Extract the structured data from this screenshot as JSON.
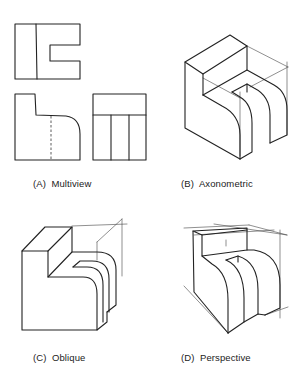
{
  "figure": {
    "panels": [
      {
        "id": "A",
        "label": "(A)",
        "name": "Multiview"
      },
      {
        "id": "B",
        "label": "(B)",
        "name": "Axonometric"
      },
      {
        "id": "C",
        "label": "(C)",
        "name": "Oblique"
      },
      {
        "id": "D",
        "label": "(D)",
        "name": "Perspective"
      }
    ],
    "colors": {
      "line": "#222222",
      "construction": "#444444",
      "background": "#ffffff"
    }
  }
}
